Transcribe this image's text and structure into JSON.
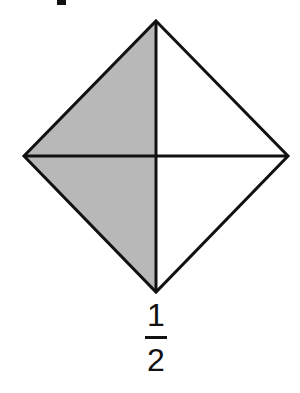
{
  "figure": {
    "shape": "square rotated 45 degrees (diamond) divided by both diagonals",
    "vertices": {
      "top": [
        156,
        21
      ],
      "right": [
        288,
        156
      ],
      "bottom": [
        156,
        292
      ],
      "left": [
        24,
        156
      ]
    },
    "shaded_region": "left half",
    "shade_color": "#b8b8b8",
    "stroke_color": "#111111",
    "fill_color": "#ffffff"
  },
  "label": {
    "numerator": "1",
    "denominator": "2"
  }
}
